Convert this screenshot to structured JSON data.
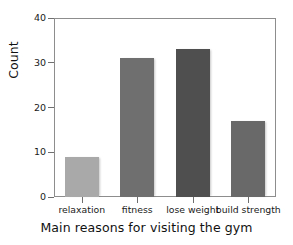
{
  "chart_data": {
    "type": "bar",
    "title": "",
    "categories": [
      "relaxation",
      "fitness",
      "lose weight",
      "build strength"
    ],
    "values": [
      9,
      31,
      33,
      17
    ],
    "xlabel": "Main reasons for visiting the gym",
    "ylabel": "Count",
    "ylim": [
      0,
      40
    ],
    "yticks": [
      0,
      10,
      20,
      30,
      40
    ],
    "ytick_labels": [
      "0",
      "10",
      "20",
      "30",
      "40"
    ],
    "grid": false,
    "legend": false,
    "legend_position": "none",
    "bar_colors": [
      "#a9a9a9",
      "#6f6f6f",
      "#4f4f4f",
      "#696969"
    ],
    "frame_color": "#8d8d8d",
    "background": "#ffffff"
  },
  "axis": {
    "y_title": "Count",
    "x_title": "Main reasons for visiting the gym",
    "y_labels": [
      "40",
      "30",
      "20",
      "10",
      "0"
    ]
  }
}
